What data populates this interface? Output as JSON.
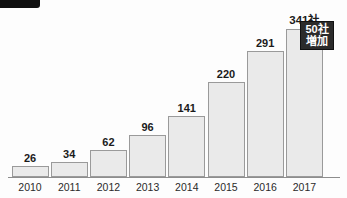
{
  "header": {
    "badge_label": "",
    "title": ""
  },
  "callout": {
    "line1": "50社",
    "line2": "増加"
  },
  "top_value_label": "341社",
  "colors": {
    "bar_fill": "#eaeaea",
    "bar_border": "#9a9a9a",
    "axis": "#8d8d8d",
    "callout_bg": "#2b2b2b",
    "callout_text": "#ffffff",
    "badge": "#101010",
    "value_text": "#1b1b1b"
  },
  "chart_data": {
    "type": "bar",
    "title": "",
    "xlabel": "",
    "ylabel": "",
    "categories": [
      "2010",
      "2011",
      "2012",
      "2013",
      "2014",
      "2015",
      "2016",
      "2017"
    ],
    "values": [
      26,
      34,
      62,
      96,
      141,
      220,
      291,
      341
    ],
    "value_labels": [
      "26",
      "34",
      "62",
      "96",
      "141",
      "220",
      "291",
      "341社"
    ],
    "ylim": [
      0,
      341
    ],
    "grid": false,
    "legend": "none",
    "annotations": [
      {
        "target": "2017",
        "text": "50社 増加"
      }
    ]
  }
}
